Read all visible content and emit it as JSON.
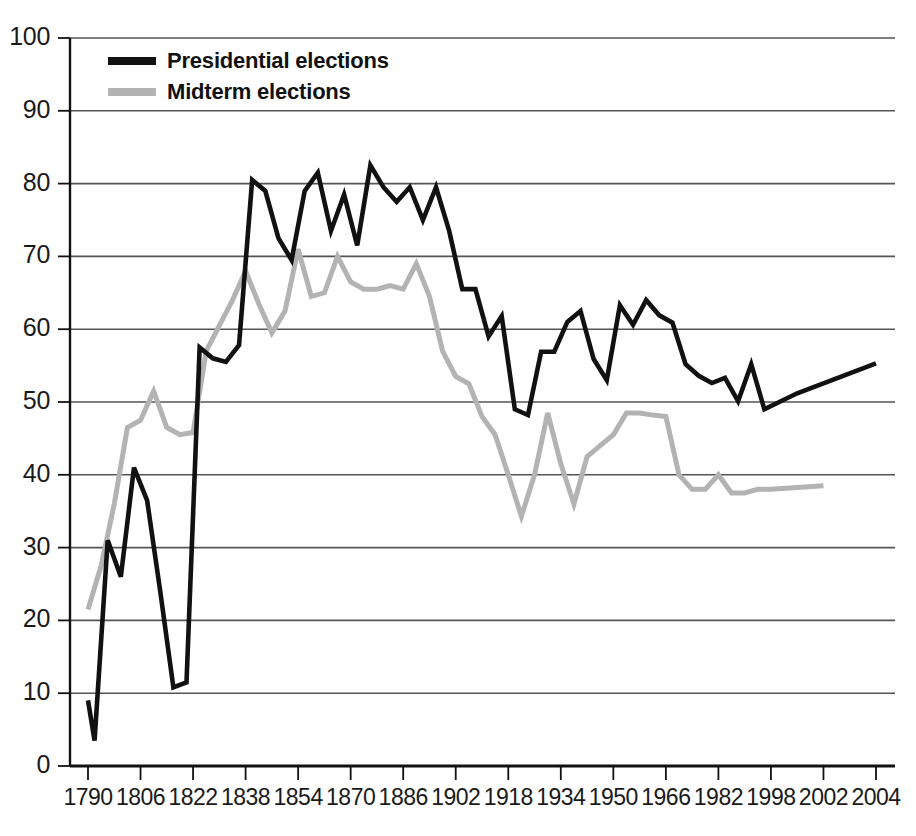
{
  "chart_data": {
    "type": "line",
    "title": "",
    "subtitle": "",
    "xlabel": "",
    "ylabel": "",
    "xlim": [
      1788,
      2012
    ],
    "ylim": [
      0,
      100
    ],
    "grid": true,
    "grid_axis": "y",
    "legend_position": "top-left",
    "x_tick_labels": [
      "1790",
      "1806",
      "1822",
      "1838",
      "1854",
      "1870",
      "1886",
      "1902",
      "1918",
      "1934",
      "1950",
      "1966",
      "1982",
      "1998",
      "2002",
      "2004"
    ],
    "x_tick_values": [
      1790,
      1806,
      1822,
      1838,
      1854,
      1870,
      1886,
      1902,
      1918,
      1934,
      1950,
      1966,
      1982,
      1998,
      2002,
      2004
    ],
    "y_tick_labels": [
      "0",
      "10",
      "20",
      "30",
      "40",
      "50",
      "60",
      "70",
      "80",
      "90",
      "100"
    ],
    "y_tick_values": [
      0,
      10,
      20,
      30,
      40,
      50,
      60,
      70,
      80,
      90,
      100
    ],
    "colors": {
      "presidential": "#111111",
      "midterm": "#b3b3b3",
      "axis": "#111111",
      "grid": "#555555",
      "background": "#ffffff"
    },
    "series": [
      {
        "name": "Presidential elections",
        "color": "#111111",
        "x": [
          1790,
          1792,
          1796,
          1800,
          1804,
          1808,
          1812,
          1816,
          1820,
          1824,
          1828,
          1832,
          1836,
          1840,
          1844,
          1848,
          1852,
          1856,
          1860,
          1864,
          1868,
          1872,
          1876,
          1880,
          1884,
          1888,
          1892,
          1896,
          1900,
          1904,
          1908,
          1912,
          1916,
          1920,
          1924,
          1928,
          1932,
          1936,
          1940,
          1944,
          1948,
          1952,
          1956,
          1960,
          1964,
          1968,
          1972,
          1976,
          1980,
          1984,
          1988,
          1992,
          1996,
          2000,
          2004
        ],
        "values": [
          9.0,
          3.5,
          31.0,
          26.0,
          41.0,
          36.5,
          24.0,
          10.8,
          11.5,
          57.5,
          56.0,
          55.5,
          57.8,
          80.5,
          79.0,
          72.5,
          69.5,
          79.0,
          81.5,
          73.5,
          78.5,
          71.5,
          82.5,
          79.5,
          77.5,
          79.5,
          75.0,
          79.5,
          73.5,
          65.5,
          65.5,
          59.0,
          61.8,
          49.0,
          48.2,
          56.9,
          56.9,
          61.0,
          62.5,
          55.9,
          53.0,
          63.3,
          60.6,
          64.0,
          61.9,
          60.9,
          55.2,
          53.6,
          52.6,
          53.3,
          50.1,
          55.2,
          49.0,
          51.2,
          55.3
        ]
      },
      {
        "name": "Midterm elections",
        "color": "#b3b3b3",
        "x": [
          1790,
          1794,
          1798,
          1802,
          1806,
          1810,
          1814,
          1818,
          1822,
          1826,
          1830,
          1834,
          1838,
          1842,
          1846,
          1850,
          1854,
          1858,
          1862,
          1866,
          1870,
          1874,
          1878,
          1882,
          1886,
          1890,
          1894,
          1898,
          1902,
          1906,
          1910,
          1914,
          1918,
          1922,
          1926,
          1930,
          1934,
          1938,
          1942,
          1946,
          1950,
          1954,
          1958,
          1962,
          1966,
          1970,
          1974,
          1978,
          1982,
          1986,
          1990,
          1994,
          1998,
          2002
        ],
        "values": [
          21.5,
          27.5,
          36.0,
          46.5,
          47.5,
          51.5,
          46.5,
          45.5,
          45.8,
          57.0,
          60.5,
          64.0,
          68.0,
          63.5,
          59.5,
          62.5,
          71.0,
          64.5,
          65.0,
          70.0,
          66.5,
          65.5,
          65.5,
          66.0,
          65.5,
          69.0,
          64.5,
          57.0,
          53.5,
          52.5,
          48.0,
          45.5,
          40.0,
          34.3,
          40.0,
          48.5,
          41.5,
          36.0,
          42.5,
          44.0,
          45.5,
          48.5,
          48.5,
          48.2,
          48.0,
          40.0,
          38.0,
          38.0,
          40.0,
          37.5,
          37.5,
          38.0,
          38.0,
          38.5
        ]
      }
    ]
  },
  "legend": {
    "items": [
      {
        "label": "Presidential elections",
        "swatch_class": "presidential"
      },
      {
        "label": "Midterm elections",
        "swatch_class": "midterm"
      }
    ]
  }
}
